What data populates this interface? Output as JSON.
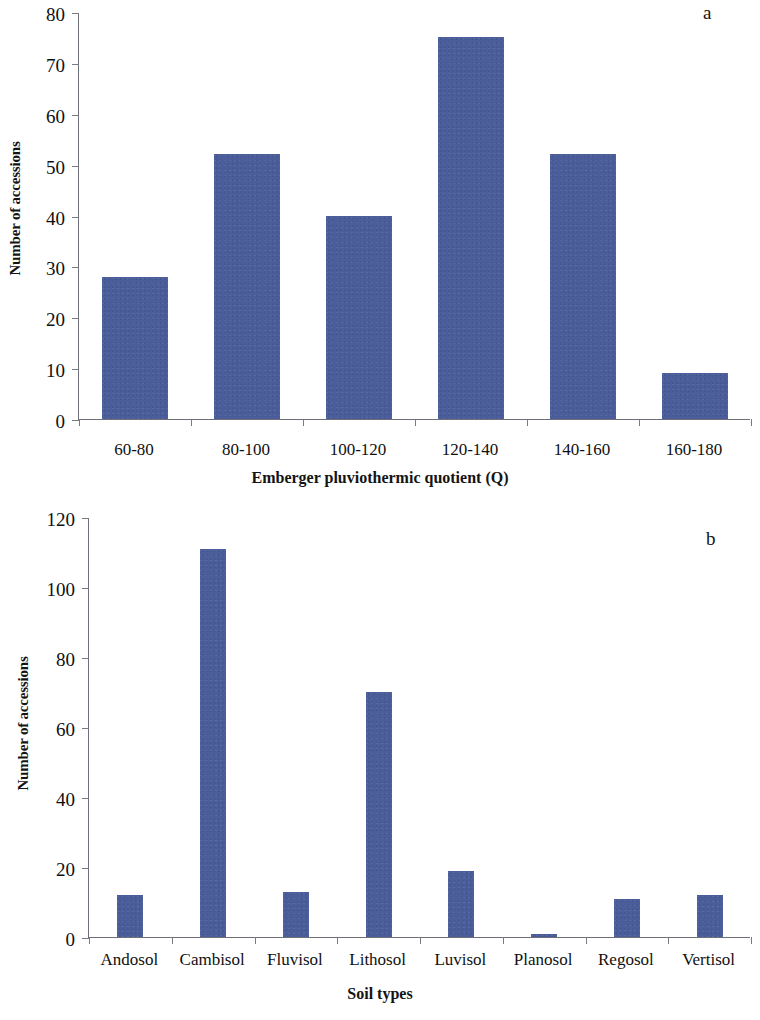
{
  "figure": {
    "background": "#ffffff",
    "bar_color": "#4b5e9b",
    "axis_color": "#6f6f77"
  },
  "panel_a": {
    "letter": "a",
    "ylabel": "Number of accessions",
    "xlabel": "Emberger pluviothermic quotient (Q)"
  },
  "panel_b": {
    "letter": "b",
    "ylabel": "Number of accessions",
    "xlabel": "Soil types"
  },
  "chart_data": [
    {
      "type": "bar",
      "panel": "a",
      "title": "",
      "xlabel": "Emberger pluviothermic quotient (Q)",
      "ylabel": "Number of accessions",
      "categories": [
        "60-80",
        "80-100",
        "100-120",
        "120-140",
        "140-160",
        "160-180"
      ],
      "values": [
        28,
        52,
        40,
        75,
        52,
        9
      ],
      "ylim": [
        0,
        80
      ],
      "yticks": [
        0,
        10,
        20,
        30,
        40,
        50,
        60,
        70,
        80
      ],
      "ytick_labels": [
        "0",
        "10",
        "20",
        "30",
        "40",
        "50",
        "60",
        "70",
        "80"
      ],
      "grid": false,
      "legend": null,
      "annotation": "a"
    },
    {
      "type": "bar",
      "panel": "b",
      "title": "",
      "xlabel": "Soil types",
      "ylabel": "Number of accessions",
      "categories": [
        "Andosol",
        "Cambisol",
        "Fluvisol",
        "Lithosol",
        "Luvisol",
        "Planosol",
        "Regosol",
        "Vertisol"
      ],
      "values": [
        12,
        111,
        13,
        70,
        19,
        1,
        11,
        12
      ],
      "ylim": [
        0,
        120
      ],
      "yticks": [
        0,
        20,
        40,
        60,
        80,
        100,
        120
      ],
      "ytick_labels": [
        "0",
        "20",
        "40",
        "60",
        "80",
        "100",
        "120"
      ],
      "grid": false,
      "legend": null,
      "annotation": "b"
    }
  ]
}
